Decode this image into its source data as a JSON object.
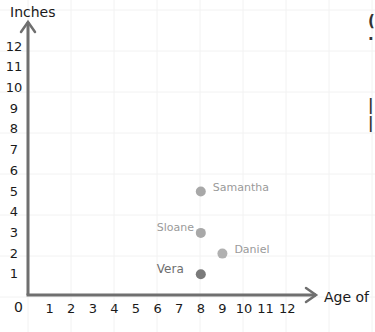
{
  "chart_data": {
    "type": "scatter",
    "title": "",
    "xlabel": "Age of",
    "ylabel": "Inches",
    "xlim": [
      0,
      12
    ],
    "ylim": [
      0,
      12
    ],
    "x_ticks": [
      "1",
      "2",
      "3",
      "4",
      "5",
      "6",
      "7",
      "8",
      "9",
      "10",
      "11",
      "12"
    ],
    "y_ticks": [
      "1",
      "2",
      "3",
      "4",
      "5",
      "6",
      "7",
      "8",
      "9",
      "10",
      "11",
      "12"
    ],
    "origin_label": "0",
    "grid": true,
    "points": [
      {
        "name": "Samantha",
        "x": 8,
        "y": 5,
        "color": "#a8a8a8"
      },
      {
        "name": "Sloane",
        "x": 8,
        "y": 3,
        "color": "#a8a8a8"
      },
      {
        "name": "Daniel",
        "x": 9,
        "y": 2,
        "color": "#b0b0b0"
      },
      {
        "name": "Vera",
        "x": 8,
        "y": 1,
        "color": "#7a7a7a"
      }
    ]
  },
  "colors": {
    "axis": "#6f6f6f",
    "grid": "#f2f2f2",
    "point_light": "#a8a8a8",
    "point_dark": "#7a7a7a"
  }
}
